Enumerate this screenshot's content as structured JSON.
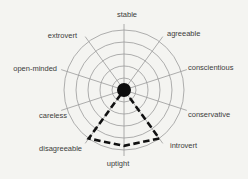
{
  "chart_data": {
    "type": "radar",
    "title": "",
    "legend": null,
    "grid": true,
    "scale": {
      "rings": 5,
      "min": 0,
      "max": 5
    },
    "axes": [
      {
        "label": "stable",
        "angle": 0,
        "value": 0,
        "label_x": 127,
        "label_y": 17,
        "anchor": "middle"
      },
      {
        "label": "agreeable",
        "angle": 36,
        "value": 0,
        "label_x": 167,
        "label_y": 36,
        "anchor": "start"
      },
      {
        "label": "conscientious",
        "angle": 72,
        "value": 0,
        "label_x": 188,
        "label_y": 70,
        "anchor": "start"
      },
      {
        "label": "conservative",
        "angle": 108,
        "value": 0,
        "label_x": 188,
        "label_y": 117,
        "anchor": "start"
      },
      {
        "label": "introvert",
        "angle": 144,
        "value": 5,
        "label_x": 170,
        "label_y": 148,
        "anchor": "start"
      },
      {
        "label": "uptight",
        "angle": 180,
        "value": 4.65,
        "label_x": 118,
        "label_y": 166,
        "anchor": "middle"
      },
      {
        "label": "disagreeable",
        "angle": 216,
        "value": 5,
        "label_x": 82,
        "label_y": 151,
        "anchor": "end"
      },
      {
        "label": "careless",
        "angle": 252,
        "value": 0,
        "label_x": 67,
        "label_y": 118,
        "anchor": "end"
      },
      {
        "label": "open-minded",
        "angle": 288,
        "value": 0,
        "label_x": 57,
        "label_y": 71,
        "anchor": "end"
      },
      {
        "label": "extrovert",
        "angle": 324,
        "value": 0,
        "label_x": 77,
        "label_y": 38,
        "anchor": "end"
      }
    ],
    "colors": {
      "background": "#f4f4f1",
      "grid": "#9b9b9b",
      "text": "#3c3c3c",
      "shape": "#111111",
      "dot": "#0d0d0d"
    },
    "layout": {
      "width": 248,
      "height": 179,
      "cx": 124,
      "cy": 90,
      "ring_step": 12,
      "value_max_r": 60,
      "spoke_r": 66,
      "dot_r": 7,
      "font_size": 7.5
    }
  }
}
